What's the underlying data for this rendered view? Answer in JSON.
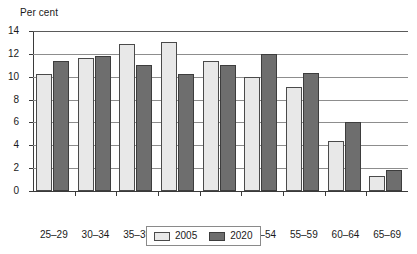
{
  "chart_data": {
    "type": "bar",
    "title": "",
    "subtitle": "",
    "xlabel": "",
    "ylabel": "Per cent",
    "categories": [
      "25–29",
      "30–34",
      "35–39",
      "40–44",
      "45–49",
      "50–54",
      "55–59",
      "60–64",
      "65–69"
    ],
    "series": [
      {
        "name": "2005",
        "color": "#e8e8e8",
        "values": [
          10.2,
          11.6,
          12.9,
          13.0,
          11.4,
          10.0,
          9.1,
          4.4,
          1.3
        ]
      },
      {
        "name": "2020",
        "color": "#6e6e6e",
        "values": [
          11.4,
          11.8,
          11.0,
          10.2,
          11.0,
          12.0,
          10.3,
          6.0,
          1.8
        ]
      }
    ],
    "ylim": [
      0,
      14
    ],
    "ytick_step": 2,
    "yticks": [
      0,
      2,
      4,
      6,
      8,
      10,
      12,
      14
    ],
    "ytick_labels": [
      "0",
      "2",
      "4",
      "6",
      "8",
      "10",
      "12",
      "14"
    ],
    "grid": true,
    "grid_axis": "y",
    "legend_position": "bottom-center"
  },
  "legend": {
    "entries": [
      {
        "label": "2005",
        "swatch": "light-gray-swatch"
      },
      {
        "label": "2020",
        "swatch": "dark-gray-swatch"
      }
    ]
  }
}
